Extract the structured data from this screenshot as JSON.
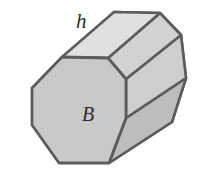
{
  "figure": {
    "name": "octagonal-prism",
    "background_color": "#ffffff",
    "labels": {
      "height": "h",
      "base": "B"
    },
    "colors": {
      "front_face": "#c9c9c9",
      "top_face_left": "#e0e0e0",
      "top_face_right": "#d2d2d2",
      "side_face_upper": "#cfcfcf",
      "side_face_lower": "#bdbdbd",
      "back_end_face": "#c4c4c4",
      "outline": "#5c5c5c",
      "inner_edge": "#6e6e6e",
      "label_color": "#2b2b2b"
    },
    "geometry": {
      "front_octagon": "62,57 108,58 126,79 126,118 109,163 59,163 32,125 32,88",
      "top_face_left": "62,57 108,58 160,13 114,12",
      "top_face_right": "108,58 126,79 181,35 160,13",
      "side_face_upper": "126,79 126,118 186,78 181,35",
      "side_face_lower": "126,118 109,163 172,122 186,78",
      "back_silhouette": "114,12 160,13 181,35 186,78 172,122 109,163"
    },
    "label_positions": {
      "h": {
        "x": 76,
        "y": 28
      },
      "B": {
        "x": 82,
        "y": 121
      }
    },
    "font_sizes": {
      "h": 21,
      "B": 20
    }
  }
}
